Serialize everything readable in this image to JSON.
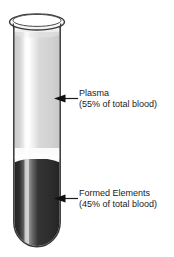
{
  "figure": {
    "tube": {
      "name": "test-tube",
      "rim_label": "tube-rim",
      "outline_color": "#3a3a3a",
      "glass_color": "#fdfdfd"
    },
    "layers": [
      {
        "id": "plasma",
        "name": "plasma-layer",
        "label_line1": "Plasma",
        "label_line2": "(55% of total blood)",
        "percent": 55,
        "color": "#d2d2d2",
        "highlight_color": "#f4f4f4"
      },
      {
        "id": "formed-elements",
        "name": "formed-elements-layer",
        "label_line1": "Formed Elements",
        "label_line2": "(45% of total blood)",
        "percent": 45,
        "color": "#2b2b2b",
        "highlight_color": "#8d8d8d"
      }
    ],
    "meniscus": {
      "name": "meniscus-band",
      "color": "#fbfbfb"
    },
    "pointers": [
      {
        "id": "plasma-pointer",
        "name": "plasma-arrow-pointer",
        "color": "#1a1a1a"
      },
      {
        "id": "formed-pointer",
        "name": "formed-elements-arrow-pointer",
        "color": "#1a1a1a"
      }
    ]
  }
}
